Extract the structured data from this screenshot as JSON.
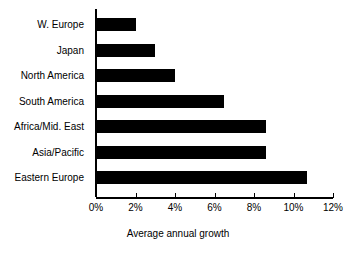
{
  "chart_data": {
    "type": "bar",
    "orientation": "horizontal",
    "title": "",
    "subtitle": "",
    "xlabel": "Average annual growth",
    "ylabel": "",
    "categories": [
      "W. Europe",
      "Japan",
      "North America",
      "South America",
      "Africa/Mid. East",
      "Asia/Pacific",
      "Eastern Europe"
    ],
    "values": [
      2.0,
      3.0,
      4.0,
      6.5,
      8.6,
      8.6,
      10.7
    ],
    "value_unit": "%",
    "xlim": [
      0,
      12
    ],
    "xticks": [
      0,
      2,
      4,
      6,
      8,
      10,
      12
    ],
    "xtick_labels": [
      "0%",
      "2%",
      "4%",
      "6%",
      "8%",
      "10%",
      "12%"
    ],
    "grid": false,
    "legend": false,
    "bar_color": "#000000",
    "background_color": "#ffffff"
  },
  "axis": {
    "title": "Average annual growth"
  }
}
